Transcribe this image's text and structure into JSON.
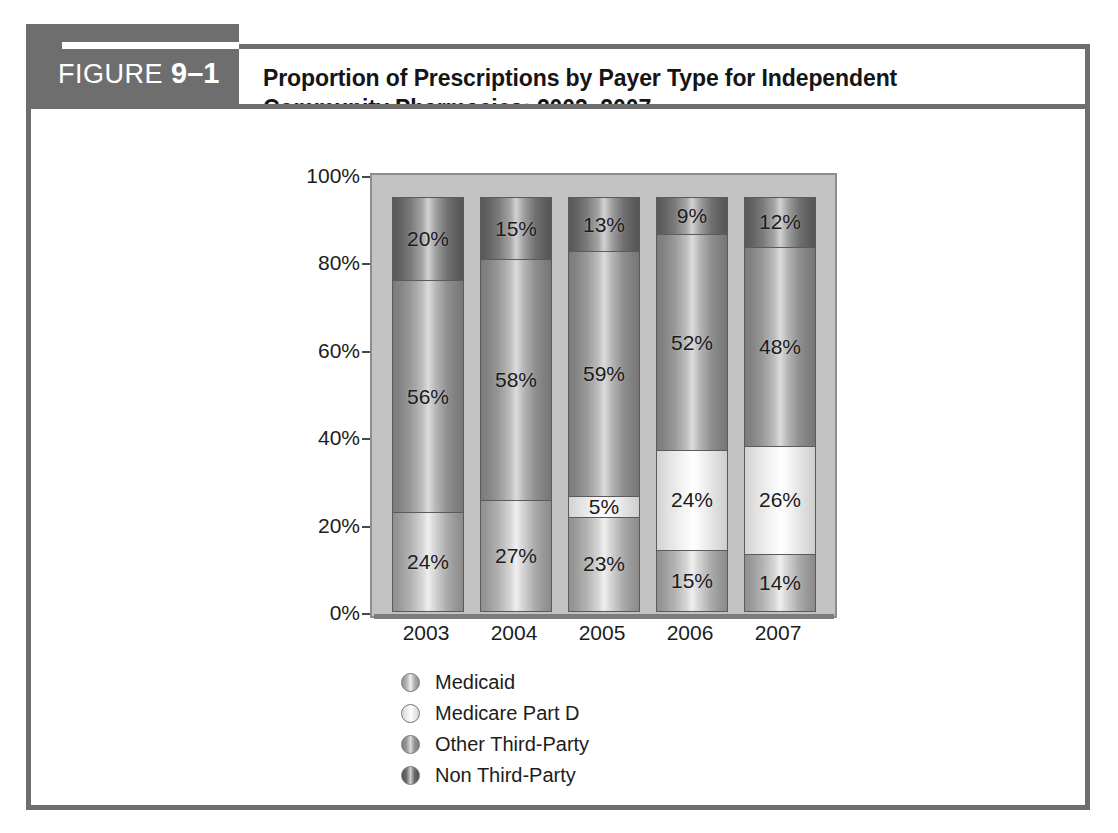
{
  "figure": {
    "tag_prefix": "FIGURE",
    "tag_number": "9–1",
    "title_line1": "Proportion of Prescriptions by Payer Type for Independent",
    "title_line2": "Community Pharmacies: 2003–2007."
  },
  "chart_data": {
    "type": "bar",
    "subtype": "stacked-100-percent",
    "title": "Proportion of Prescriptions by Payer Type for Independent Community Pharmacies: 2003–2007.",
    "xlabel": "",
    "ylabel": "",
    "ylim": [
      0,
      100
    ],
    "grid": false,
    "legend_position": "bottom-left",
    "categories": [
      "2003",
      "2004",
      "2005",
      "2006",
      "2007"
    ],
    "y_ticks": [
      "0%",
      "20%",
      "40%",
      "60%",
      "80%",
      "100%"
    ],
    "y_tick_values": [
      0,
      20,
      40,
      60,
      80,
      100
    ],
    "series": [
      {
        "name": "Medicaid",
        "color": "#b4b4b4",
        "values": [
          24,
          27,
          23,
          15,
          14
        ],
        "labels": [
          "24%",
          "27%",
          "23%",
          "15%",
          "14%"
        ]
      },
      {
        "name": "Medicare Part D",
        "color": "#efefef",
        "values": [
          0,
          0,
          5,
          24,
          26
        ],
        "labels": [
          "",
          "",
          "5%",
          "24%",
          "26%"
        ]
      },
      {
        "name": "Other Third-Party",
        "color": "#9a9a9a",
        "values": [
          56,
          58,
          59,
          52,
          48
        ],
        "labels": [
          "56%",
          "58%",
          "59%",
          "52%",
          "48%"
        ]
      },
      {
        "name": "Non Third-Party",
        "color": "#6a6a6a",
        "values": [
          20,
          15,
          13,
          9,
          12
        ],
        "labels": [
          "20%",
          "15%",
          "13%",
          "9%",
          "12%"
        ]
      }
    ]
  },
  "legend": [
    {
      "label": "Medicaid",
      "key": "medicaid"
    },
    {
      "label": "Medicare Part D",
      "key": "medicare"
    },
    {
      "label": "Other Third-Party",
      "key": "other"
    },
    {
      "label": "Non Third-Party",
      "key": "nonthird"
    }
  ]
}
